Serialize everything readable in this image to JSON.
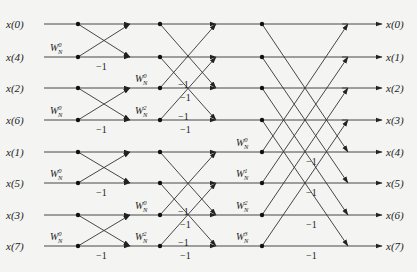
{
  "diagram": {
    "type": "radix-2 DIT FFT butterfly signal-flow graph",
    "points": 8,
    "rows_y": [
      24,
      57,
      88,
      120,
      152,
      183,
      215,
      246
    ],
    "inputs": [
      "x(0)",
      "x(4)",
      "x(2)",
      "x(6)",
      "x(1)",
      "x(5)",
      "x(3)",
      "x(7)"
    ],
    "outputs": [
      "x(0)",
      "x(1)",
      "x(2)",
      "x(3)",
      "x(4)",
      "x(5)",
      "x(6)",
      "x(7)"
    ],
    "twiddle_base": "W",
    "twiddle_sub": "N",
    "negation_label": "−1",
    "stages": [
      {
        "name": "stage-1",
        "x_start": 78,
        "x_end": 130,
        "span": 1,
        "butterflies": [
          {
            "top": 0,
            "bottom": 1,
            "twiddle": "0"
          },
          {
            "top": 2,
            "bottom": 3,
            "twiddle": "0"
          },
          {
            "top": 4,
            "bottom": 5,
            "twiddle": "0"
          },
          {
            "top": 6,
            "bottom": 7,
            "twiddle": "0"
          }
        ]
      },
      {
        "name": "stage-2",
        "x_start": 160,
        "x_end": 216,
        "span": 2,
        "butterflies": [
          {
            "top": 0,
            "bottom": 2,
            "twiddle": null
          },
          {
            "top": 1,
            "bottom": 3,
            "twiddle": null
          },
          {
            "top": 4,
            "bottom": 6,
            "twiddle": null
          },
          {
            "top": 5,
            "bottom": 7,
            "twiddle": null
          }
        ],
        "twiddle_labels": [
          {
            "row": 2,
            "exp": "0"
          },
          {
            "row": 3,
            "exp": "2"
          },
          {
            "row": 6,
            "exp": "0"
          },
          {
            "row": 7,
            "exp": "2"
          }
        ]
      },
      {
        "name": "stage-3",
        "x_start": 262,
        "x_end": 348,
        "span": 4,
        "butterflies": [
          {
            "top": 0,
            "bottom": 4,
            "twiddle": null
          },
          {
            "top": 1,
            "bottom": 5,
            "twiddle": null
          },
          {
            "top": 2,
            "bottom": 6,
            "twiddle": null
          },
          {
            "top": 3,
            "bottom": 7,
            "twiddle": null
          }
        ],
        "twiddle_labels": [
          {
            "row": 4,
            "exp": "0"
          },
          {
            "row": 5,
            "exp": "1"
          },
          {
            "row": 6,
            "exp": "2"
          },
          {
            "row": 7,
            "exp": "3"
          }
        ]
      }
    ]
  }
}
